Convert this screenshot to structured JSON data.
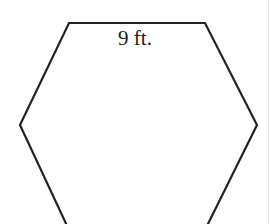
{
  "diagram": {
    "shape": "regular hexagon",
    "side_label": "9 ft.",
    "stroke_color": "#222222",
    "fill_color": "#ffffff"
  }
}
